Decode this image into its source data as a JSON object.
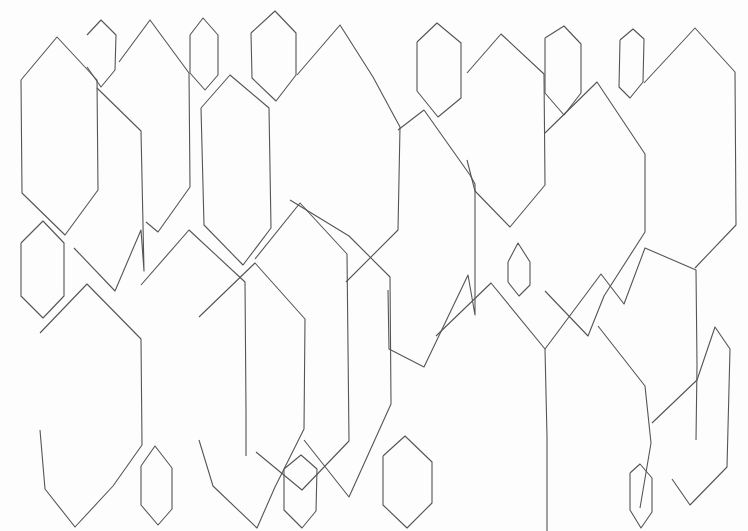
{
  "artwork": {
    "description": "Hand-drawn line sketch of overlapping elongated hexagons (crystal shapes)",
    "stroke_color": "#555555",
    "background_color": "#fdfdfd",
    "shapes": [
      "21,80 57,37 97,80 98,190 65,235 22,193 21,80",
      "87,35 101,20 116,35 115,70 101,87 87,67",
      "119,62 150,20 189,73 190,187 158,232 146,222",
      "190,35 203,18 218,35 218,75 205,90 190,73 190,35",
      "251,33 275,11 296,33 296,75 276,101 252,78 251,33",
      "297,75 340,25 373,77 400,127 398,230 346,282",
      "201,108 230,75 269,108 271,228 243,265 204,225 201,108",
      "97,88 141,131 144,271 141,230 115,291 74,248",
      "417,42 437,23 461,43 461,98 438,117 417,91 417,42",
      "467,73 501,34 544,74 545,185 510,227 475,191 467,160",
      "545,38 564,26 581,44 581,93 564,115 545,93 545,38",
      "620,40 633,29 644,39 643,82 630,98 619,87 620,40",
      "644,83 695,28 735,72 736,225 695,268",
      "545,133 597,82 645,154 645,232 604,296 588,336 545,291",
      "398,130 424,110 470,175 475,184 475,315 468,275 424,367 389,349 388,290",
      "508,262 518,243 530,262 530,285 519,296 508,282 508,262",
      "21,243 43,221 64,243 64,296 43,318 21,296 21,243",
      "40,333 87,284 141,339 142,445 113,486 75,527 45,489 40,430",
      "141,285 189,230 245,282 246,411 246,456",
      "199,317 255,263 305,319 304,429 275,487 257,528 213,486 199,440",
      "255,259 300,203 347,254 349,441 302,490 256,452",
      "290,200 349,236 390,277 391,404 349,497 304,440",
      "141,466 155,446 172,468 172,509 158,525 141,505 141,466",
      "284,469 301,455 317,469 316,511 302,528 284,510 284,469",
      "383,456 405,436 432,462 432,503 407,528 383,505 383,456",
      "436,336 491,283 545,349 547,437 547,531",
      "545,349 601,274 624,304 645,248 696,270 697,365 696,440",
      "598,326 645,386 651,443 640,508",
      "630,473 640,464 652,478 652,512 641,528 630,510 630,473",
      "652,423 697,380 715,327 730,349 727,467 690,505 672,479"
    ]
  }
}
